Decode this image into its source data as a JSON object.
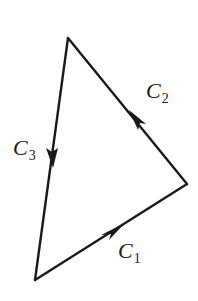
{
  "diagram": {
    "stroke_color": "#1a1a1a",
    "vertices": {
      "top": [
        68,
        38
      ],
      "right": [
        187,
        184
      ],
      "bottom_left": [
        35,
        280
      ]
    },
    "curves": [
      {
        "id": "C1",
        "letter": "C",
        "subscript": "1",
        "from": "bottom_left",
        "to": "right",
        "arrow_at": [
          117,
          228
        ],
        "label_pos": [
          118,
          240
        ]
      },
      {
        "id": "C2",
        "letter": "C",
        "subscript": "2",
        "from": "right",
        "to": "top",
        "arrow_at": [
          135,
          122
        ],
        "label_pos": [
          146,
          80
        ]
      },
      {
        "id": "C3",
        "letter": "C",
        "subscript": "3",
        "from": "top",
        "to": "bottom_left",
        "arrow_at": [
          53,
          155
        ],
        "label_pos": [
          13,
          137
        ]
      }
    ]
  }
}
